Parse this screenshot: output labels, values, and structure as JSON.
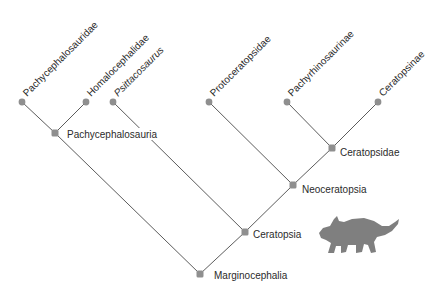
{
  "diagram": {
    "type": "cladogram",
    "colors": {
      "edge": "#4a4a4a",
      "node": "#8f8f8f",
      "text": "#2b2b2b",
      "silhouette": "#7f7f7f",
      "background": "#ffffff"
    },
    "tips": [
      {
        "id": "pachycephalosauridae",
        "label": "Pachycephalosauridae",
        "italic": false
      },
      {
        "id": "homalocephalidae",
        "label": "Homalocephalidae",
        "italic": false
      },
      {
        "id": "psittacosaurus",
        "label": "Psittacosaurus",
        "italic": true
      },
      {
        "id": "protoceratopsidae",
        "label": "Protoceratopsidae",
        "italic": false
      },
      {
        "id": "pachyrhinosaurinae",
        "label": "Pachyrhinosaurinae",
        "italic": false
      },
      {
        "id": "ceratopsinae",
        "label": "Ceratopsinae",
        "italic": false
      }
    ],
    "clades": [
      {
        "id": "pachycephalosauria",
        "label": "Pachycephalosauria"
      },
      {
        "id": "ceratopsidae",
        "label": "Ceratopsidae"
      },
      {
        "id": "neoceratopsia",
        "label": "Neoceratopsia"
      },
      {
        "id": "ceratopsia",
        "label": "Ceratopsia"
      },
      {
        "id": "marginocephalia",
        "label": "Marginocephalia"
      }
    ],
    "edges": [
      [
        "pachycephalosauridae",
        "pachycephalosauria"
      ],
      [
        "homalocephalidae",
        "pachycephalosauria"
      ],
      [
        "pachycephalosauria",
        "marginocephalia"
      ],
      [
        "psittacosaurus",
        "ceratopsia"
      ],
      [
        "protoceratopsidae",
        "neoceratopsia"
      ],
      [
        "pachyrhinosaurinae",
        "ceratopsidae"
      ],
      [
        "ceratopsinae",
        "ceratopsidae"
      ],
      [
        "ceratopsidae",
        "neoceratopsia"
      ],
      [
        "neoceratopsia",
        "ceratopsia"
      ],
      [
        "ceratopsia",
        "marginocephalia"
      ]
    ],
    "illustration": "ceratopsian-dinosaur-silhouette"
  }
}
